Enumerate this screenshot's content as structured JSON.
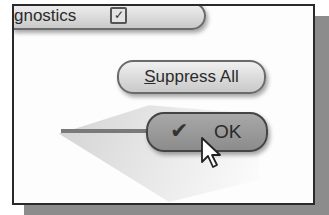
{
  "dialog": {
    "diagnostics_label": "gnostics",
    "diagnostics_checked": true,
    "suppress_button": {
      "label_first": "S",
      "label_rest": "uppress All"
    },
    "ok_button": {
      "icon": "checkmark-icon",
      "label": "OK",
      "check_glyph": "✔"
    },
    "checkbox_glyph": "✓"
  }
}
